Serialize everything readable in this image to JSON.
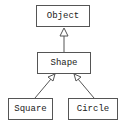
{
  "diagram": {
    "type": "uml-class-hierarchy",
    "nodes": [
      {
        "id": "object",
        "label": "Object"
      },
      {
        "id": "shape",
        "label": "Shape"
      },
      {
        "id": "square",
        "label": "Square"
      },
      {
        "id": "circle",
        "label": "Circle"
      }
    ],
    "edges": [
      {
        "from": "shape",
        "to": "object",
        "kind": "inheritance"
      },
      {
        "from": "square",
        "to": "shape",
        "kind": "inheritance"
      },
      {
        "from": "circle",
        "to": "shape",
        "kind": "inheritance"
      }
    ],
    "colors": {
      "line": "#555555",
      "text": "#222222",
      "background": "#ffffff"
    }
  }
}
